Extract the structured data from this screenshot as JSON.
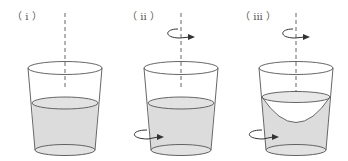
{
  "figure": {
    "panels": [
      {
        "label": "（ i ）",
        "rotating": false,
        "surface": "flat"
      },
      {
        "label": "（ ii ）",
        "rotating": true,
        "surface": "flat"
      },
      {
        "label": "（ iii ）",
        "rotating": true,
        "surface": "paraboloid"
      }
    ],
    "colors": {
      "outline": "#555555",
      "water": "#dcdcdc",
      "arrow": "#333333"
    }
  }
}
